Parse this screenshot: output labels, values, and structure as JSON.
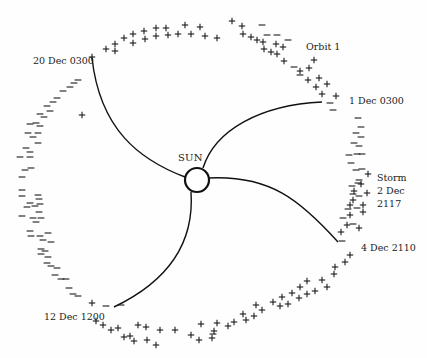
{
  "diagram": {
    "center_label": "SUN",
    "labels": [
      {
        "id": "orbit",
        "text": "Orbit 1",
        "x": 306,
        "y": 41
      },
      {
        "id": "dec1",
        "text": "1 Dec 0300",
        "x": 349,
        "y": 95
      },
      {
        "id": "dec20",
        "text": "20 Dec 0300",
        "x": 33,
        "y": 55
      },
      {
        "id": "dec4",
        "text": "4 Dec 2110",
        "x": 361,
        "y": 242
      },
      {
        "id": "dec12",
        "text": "12 Dec 1200",
        "x": 44,
        "y": 311
      }
    ],
    "storm_label": [
      "Storm",
      "2 Dec",
      "2117"
    ],
    "sun": {
      "cx": 197,
      "cy": 180,
      "r": 12
    },
    "sector_boundaries": [
      {
        "from": "20 Dec 0300",
        "path": "M 92 58 C 100 130, 140 160, 185 177"
      },
      {
        "from": "1 Dec 0300",
        "path": "M 322 102 C 260 105, 215 130, 203 168"
      },
      {
        "from": "4 Dec 2110",
        "path": "M 338 242 C 300 200, 270 175, 209 178"
      },
      {
        "from": "12 Dec 1200",
        "path": "M 114 307 C 160 285, 195 250, 191 192"
      }
    ],
    "polarity_marks": {
      "plus": [
        [
          92,
          57
        ],
        [
          106,
          49
        ],
        [
          115,
          44
        ],
        [
          115,
          51
        ],
        [
          124,
          38
        ],
        [
          133,
          34
        ],
        [
          133,
          43
        ],
        [
          144,
          31
        ],
        [
          145,
          39
        ],
        [
          156,
          28
        ],
        [
          156,
          36
        ],
        [
          166,
          28
        ],
        [
          168,
          35
        ],
        [
          178,
          34
        ],
        [
          185,
          25
        ],
        [
          191,
          34
        ],
        [
          200,
          27
        ],
        [
          205,
          36
        ],
        [
          217,
          38
        ],
        [
          232,
          21
        ],
        [
          242,
          26
        ],
        [
          243,
          34
        ],
        [
          251,
          37
        ],
        [
          257,
          40
        ],
        [
          264,
          49
        ],
        [
          263,
          42
        ],
        [
          271,
          52
        ],
        [
          277,
          54
        ],
        [
          276,
          44
        ],
        [
          283,
          47
        ],
        [
          284,
          61
        ],
        [
          300,
          71
        ],
        [
          309,
          68
        ],
        [
          314,
          60
        ],
        [
          308,
          80
        ],
        [
          319,
          78
        ],
        [
          316,
          87
        ],
        [
          327,
          84
        ],
        [
          322,
          94
        ],
        [
          336,
          96
        ],
        [
          368,
          174
        ],
        [
          361,
          184
        ],
        [
          354,
          191
        ],
        [
          367,
          193
        ],
        [
          353,
          200
        ],
        [
          350,
          205
        ],
        [
          363,
          205
        ],
        [
          350,
          215
        ],
        [
          363,
          212
        ],
        [
          347,
          225
        ],
        [
          341,
          232
        ],
        [
          359,
          228
        ],
        [
          350,
          255
        ],
        [
          345,
          262
        ],
        [
          335,
          267
        ],
        [
          334,
          274
        ],
        [
          322,
          280
        ],
        [
          327,
          287
        ],
        [
          307,
          281
        ],
        [
          300,
          287
        ],
        [
          315,
          291
        ],
        [
          307,
          294
        ],
        [
          299,
          298
        ],
        [
          292,
          293
        ],
        [
          288,
          304
        ],
        [
          282,
          297
        ],
        [
          273,
          302
        ],
        [
          280,
          306
        ],
        [
          256,
          305
        ],
        [
          262,
          310
        ],
        [
          254,
          316
        ],
        [
          243,
          314
        ],
        [
          234,
          322
        ],
        [
          246,
          320
        ],
        [
          228,
          326
        ],
        [
          217,
          323
        ],
        [
          214,
          331
        ],
        [
          212,
          338
        ],
        [
          191,
          335
        ],
        [
          201,
          324
        ],
        [
          199,
          340
        ],
        [
          175,
          330
        ],
        [
          160,
          330
        ],
        [
          156,
          345
        ],
        [
          147,
          340
        ],
        [
          146,
          327
        ],
        [
          138,
          325
        ],
        [
          134,
          341
        ],
        [
          130,
          336
        ],
        [
          124,
          337
        ],
        [
          118,
          328
        ],
        [
          111,
          330
        ],
        [
          103,
          325
        ],
        [
          92,
          303
        ],
        [
          96,
          321
        ],
        [
          82,
          115
        ]
      ],
      "minus": [
        [
          262,
          25
        ],
        [
          267,
          35
        ],
        [
          277,
          35
        ],
        [
          288,
          40
        ],
        [
          294,
          67
        ],
        [
          300,
          75
        ],
        [
          330,
          103
        ],
        [
          333,
          110
        ],
        [
          358,
          118
        ],
        [
          361,
          127
        ],
        [
          356,
          133
        ],
        [
          361,
          137
        ],
        [
          354,
          143
        ],
        [
          359,
          146
        ],
        [
          349,
          155
        ],
        [
          357,
          154
        ],
        [
          362,
          154
        ],
        [
          351,
          163
        ],
        [
          356,
          170
        ],
        [
          362,
          169
        ],
        [
          359,
          180
        ],
        [
          352,
          186
        ],
        [
          358,
          183
        ],
        [
          353,
          194
        ],
        [
          359,
          196
        ],
        [
          348,
          209
        ],
        [
          357,
          208
        ],
        [
          343,
          218
        ],
        [
          353,
          224
        ],
        [
          342,
          241
        ],
        [
          78,
          80
        ],
        [
          74,
          83
        ],
        [
          70,
          87
        ],
        [
          63,
          91
        ],
        [
          57,
          98
        ],
        [
          53,
          102
        ],
        [
          47,
          106
        ],
        [
          50,
          111
        ],
        [
          40,
          114
        ],
        [
          44,
          117
        ],
        [
          36,
          123
        ],
        [
          30,
          124
        ],
        [
          40,
          126
        ],
        [
          28,
          133
        ],
        [
          38,
          133
        ],
        [
          33,
          137
        ],
        [
          38,
          143
        ],
        [
          26,
          148
        ],
        [
          30,
          152
        ],
        [
          20,
          157
        ],
        [
          30,
          157
        ],
        [
          31,
          168
        ],
        [
          25,
          170
        ],
        [
          22,
          177
        ],
        [
          22,
          190
        ],
        [
          22,
          196
        ],
        [
          38,
          195
        ],
        [
          39,
          199
        ],
        [
          30,
          203
        ],
        [
          40,
          204
        ],
        [
          35,
          206
        ],
        [
          27,
          207
        ],
        [
          39,
          212
        ],
        [
          22,
          216
        ],
        [
          33,
          218
        ],
        [
          41,
          218
        ],
        [
          36,
          222
        ],
        [
          30,
          231
        ],
        [
          48,
          233
        ],
        [
          31,
          236
        ],
        [
          40,
          236
        ],
        [
          43,
          240
        ],
        [
          51,
          242
        ],
        [
          41,
          249
        ],
        [
          45,
          251
        ],
        [
          41,
          254
        ],
        [
          48,
          257
        ],
        [
          47,
          263
        ],
        [
          51,
          266
        ],
        [
          57,
          268
        ],
        [
          55,
          275
        ],
        [
          61,
          279
        ],
        [
          66,
          279
        ],
        [
          69,
          288
        ],
        [
          73,
          294
        ],
        [
          78,
          296
        ],
        [
          106,
          306
        ],
        [
          121,
          305
        ],
        [
          213,
          334
        ]
      ]
    }
  }
}
